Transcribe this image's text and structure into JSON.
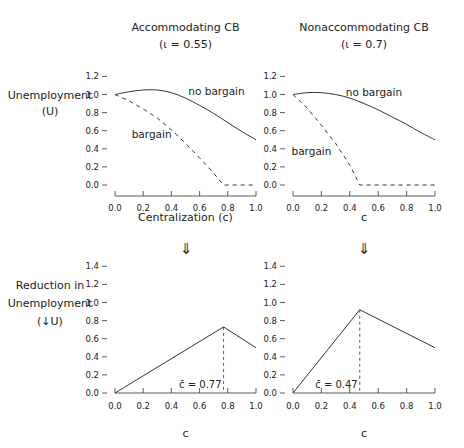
{
  "figure": {
    "arrow_glyph": "⇓",
    "row_labels": {
      "top": [
        "Unemployment",
        "(U)"
      ],
      "bottom": [
        "Reduction in",
        "Unemployment",
        "(↓U)"
      ]
    }
  },
  "chart_data": [
    {
      "id": "top-left",
      "type": "line",
      "title": "Accommodating CB",
      "subtitle": "(ι = 0.55)",
      "xlabel": "Centralization (c)",
      "ylabel": "Unemployment (U)",
      "xlim": [
        0,
        1
      ],
      "ylim": [
        0,
        1.2
      ],
      "xticks": [
        "0.0",
        "0.2",
        "0.4",
        "0.6",
        "0.8",
        "1.0"
      ],
      "yticks": [
        "0.0",
        "0.2",
        "0.4",
        "0.6",
        "0.8",
        "1.0",
        "1.2"
      ],
      "series": [
        {
          "name": "no bargain",
          "style": "solid",
          "x": [
            0,
            0.1,
            0.2,
            0.3,
            0.4,
            0.5,
            0.6,
            0.7,
            0.8,
            0.9,
            1.0
          ],
          "y": [
            1.0,
            1.03,
            1.05,
            1.05,
            1.02,
            0.96,
            0.88,
            0.79,
            0.69,
            0.59,
            0.5
          ]
        },
        {
          "name": "bargain",
          "style": "dashed",
          "x": [
            0,
            0.1,
            0.2,
            0.3,
            0.4,
            0.5,
            0.6,
            0.7,
            0.77,
            0.8,
            1.0
          ],
          "y": [
            1.0,
            0.93,
            0.84,
            0.74,
            0.61,
            0.46,
            0.3,
            0.13,
            0.0,
            0.0,
            0.0
          ]
        }
      ],
      "annotations": [
        {
          "text": "no bargain",
          "x": 0.72,
          "y": 1.03
        },
        {
          "text": "bargain",
          "x": 0.26,
          "y": 0.55
        }
      ]
    },
    {
      "id": "top-right",
      "type": "line",
      "title": "Nonaccommodating CB",
      "subtitle": "(ι = 0.7)",
      "xlabel": "c",
      "ylabel": "Unemployment (U)",
      "xlim": [
        0,
        1
      ],
      "ylim": [
        0,
        1.2
      ],
      "xticks": [
        "0.0",
        "0.2",
        "0.4",
        "0.6",
        "0.8",
        "1.0"
      ],
      "yticks": [
        "0.0",
        "0.2",
        "0.4",
        "0.6",
        "0.8",
        "1.0",
        "1.2"
      ],
      "series": [
        {
          "name": "no bargain",
          "style": "solid",
          "x": [
            0,
            0.1,
            0.2,
            0.3,
            0.4,
            0.5,
            0.6,
            0.7,
            0.8,
            0.9,
            1.0
          ],
          "y": [
            1.0,
            1.02,
            1.02,
            1.0,
            0.96,
            0.9,
            0.83,
            0.75,
            0.67,
            0.58,
            0.5
          ]
        },
        {
          "name": "bargain",
          "style": "dashed",
          "x": [
            0,
            0.1,
            0.2,
            0.3,
            0.4,
            0.47,
            0.5,
            1.0
          ],
          "y": [
            1.0,
            0.85,
            0.66,
            0.46,
            0.22,
            0.0,
            0.0,
            0.0
          ]
        }
      ],
      "annotations": [
        {
          "text": "no bargain",
          "x": 0.57,
          "y": 1.02
        },
        {
          "text": "bargain",
          "x": 0.13,
          "y": 0.36
        }
      ]
    },
    {
      "id": "bottom-left",
      "type": "line",
      "xlabel": "c",
      "ylabel": "Reduction in Unemployment (↓U)",
      "xlim": [
        0,
        1
      ],
      "ylim": [
        0,
        1.4
      ],
      "xticks": [
        "0.0",
        "0.2",
        "0.4",
        "0.6",
        "0.8",
        "1.0"
      ],
      "yticks": [
        "0.0",
        "0.2",
        "0.4",
        "0.6",
        "0.8",
        "1.0",
        "1.2",
        "1.4"
      ],
      "series": [
        {
          "name": "reduction",
          "style": "solid",
          "x": [
            0,
            0.77,
            1.0
          ],
          "y": [
            0,
            0.73,
            0.5
          ]
        }
      ],
      "vline": {
        "x": 0.77,
        "y_top": 0.73,
        "style": "dashed"
      },
      "annotations": [
        {
          "text": "c̄ = 0.77",
          "x": 0.77,
          "y": 0.05
        }
      ]
    },
    {
      "id": "bottom-right",
      "type": "line",
      "xlabel": "c",
      "ylabel": "",
      "xlim": [
        0,
        1
      ],
      "ylim": [
        0,
        1.4
      ],
      "xticks": [
        "0.0",
        "0.2",
        "0.4",
        "0.6",
        "0.8",
        "1.0"
      ],
      "yticks": [
        "0.0",
        "0.2",
        "0.4",
        "0.6",
        "0.8",
        "1.0",
        "1.2",
        "1.4"
      ],
      "series": [
        {
          "name": "reduction",
          "style": "solid",
          "x": [
            0,
            0.47,
            1.0
          ],
          "y": [
            0,
            0.92,
            0.5
          ]
        }
      ],
      "vline": {
        "x": 0.47,
        "y_top": 0.92,
        "style": "dashed"
      },
      "annotations": [
        {
          "text": "c̄ = 0.47",
          "x": 0.47,
          "y": 0.05
        }
      ]
    }
  ]
}
